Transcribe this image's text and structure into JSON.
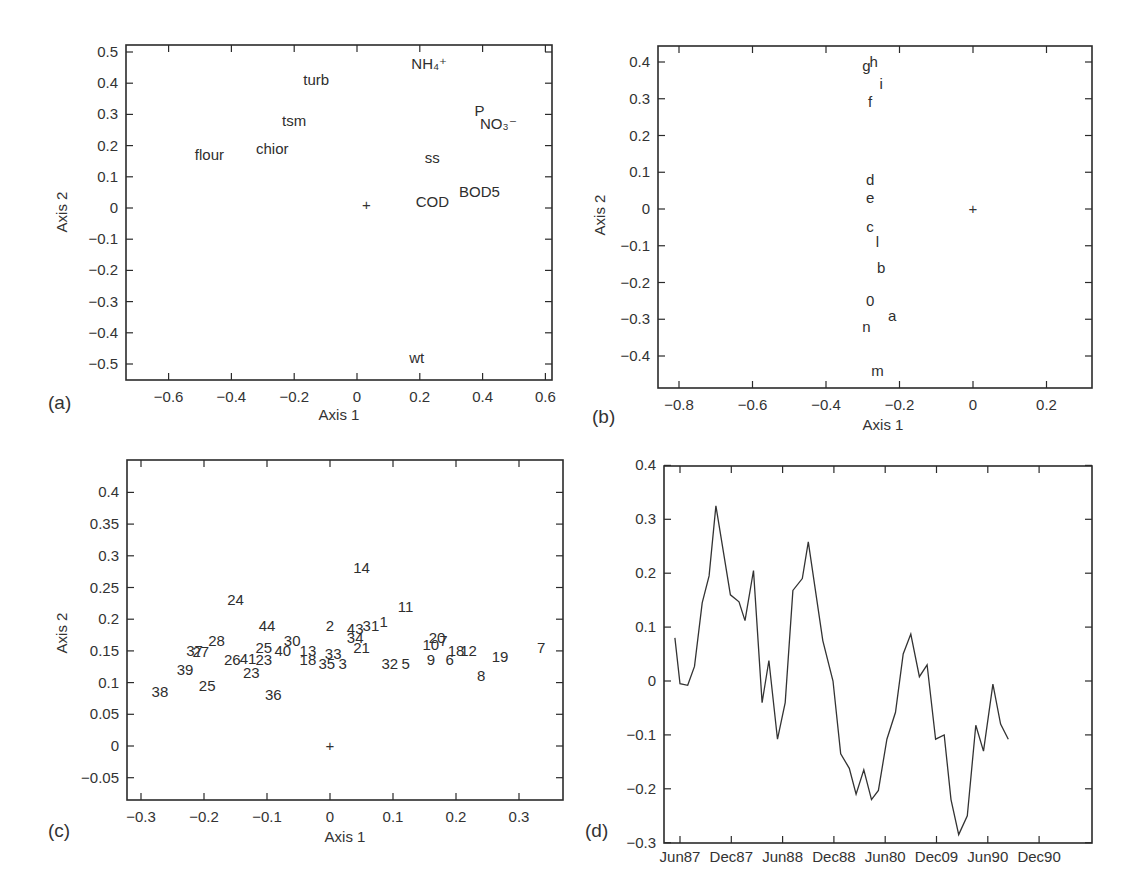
{
  "chart_data": [
    {
      "id": "a",
      "type": "scatter",
      "panel_label": "(a)",
      "title": "",
      "xlabel": "Axis 1",
      "ylabel": "Axis 2",
      "xlim": [
        -0.73,
        0.62
      ],
      "ylim": [
        -0.55,
        0.52
      ],
      "grid": false,
      "xticks": [
        -0.6,
        -0.4,
        -0.2,
        0,
        0.2,
        0.4,
        0.6
      ],
      "xtick_labels": [
        "−0.6",
        "−0.4",
        "−0.2",
        "0",
        "0.2",
        "0.4",
        "0.6"
      ],
      "yticks": [
        0.5,
        0.4,
        0.3,
        0.2,
        0.1,
        0,
        -0.1,
        -0.2,
        -0.3,
        -0.4,
        -0.5
      ],
      "ytick_labels": [
        "0.5",
        "0.4",
        "0.3",
        "0.2",
        "0.1",
        "0",
        "−0.1",
        "−0.2",
        "−0.3",
        "−0.4",
        "−0.5"
      ],
      "origin_marker": {
        "x": 0.03,
        "y": 0.01,
        "symbol": "+"
      },
      "points": [
        {
          "label": "turb",
          "x": -0.13,
          "y": 0.41
        },
        {
          "label": "NH₄⁺",
          "x": 0.23,
          "y": 0.46
        },
        {
          "label": "tsm",
          "x": -0.2,
          "y": 0.28
        },
        {
          "label": "P",
          "x": 0.39,
          "y": 0.31
        },
        {
          "label": "NO₃⁻",
          "x": 0.45,
          "y": 0.27
        },
        {
          "label": "flour",
          "x": -0.47,
          "y": 0.17
        },
        {
          "label": "chior",
          "x": -0.27,
          "y": 0.19
        },
        {
          "label": "ss",
          "x": 0.24,
          "y": 0.16
        },
        {
          "label": "COD",
          "x": 0.24,
          "y": 0.02
        },
        {
          "label": "BOD5",
          "x": 0.39,
          "y": 0.05
        },
        {
          "label": "wt",
          "x": 0.19,
          "y": -0.48
        }
      ]
    },
    {
      "id": "b",
      "type": "scatter",
      "panel_label": "(b)",
      "title": "",
      "xlabel": "Axis 1",
      "ylabel": "Axis 2",
      "xlim": [
        -0.86,
        0.32
      ],
      "ylim": [
        -0.48,
        0.45
      ],
      "grid": false,
      "xticks": [
        -0.8,
        -0.6,
        -0.4,
        -0.2,
        0,
        0.2
      ],
      "xtick_labels": [
        "−0.8",
        "−0.6",
        "−0.4",
        "−0.2",
        "0",
        "0.2"
      ],
      "yticks": [
        0.4,
        0.3,
        0.2,
        0.1,
        0,
        -0.1,
        -0.2,
        -0.3,
        -0.4
      ],
      "ytick_labels": [
        "0.4",
        "0.3",
        "0.2",
        "0.1",
        "0",
        "−0.1",
        "−0.2",
        "−0.3",
        "−0.4"
      ],
      "origin_marker": {
        "x": 0.0,
        "y": 0.0,
        "symbol": "+"
      },
      "points": [
        {
          "label": "g",
          "x": -0.29,
          "y": 0.39
        },
        {
          "label": "h",
          "x": -0.27,
          "y": 0.4
        },
        {
          "label": "i",
          "x": -0.25,
          "y": 0.34
        },
        {
          "label": "f",
          "x": -0.28,
          "y": 0.29
        },
        {
          "label": "d",
          "x": -0.28,
          "y": 0.08
        },
        {
          "label": "e",
          "x": -0.28,
          "y": 0.03
        },
        {
          "label": "c",
          "x": -0.28,
          "y": -0.05
        },
        {
          "label": "l",
          "x": -0.26,
          "y": -0.09
        },
        {
          "label": "b",
          "x": -0.25,
          "y": -0.16
        },
        {
          "label": "0",
          "x": -0.28,
          "y": -0.25
        },
        {
          "label": "a",
          "x": -0.22,
          "y": -0.29
        },
        {
          "label": "n",
          "x": -0.29,
          "y": -0.32
        },
        {
          "label": "m",
          "x": -0.26,
          "y": -0.44
        }
      ]
    },
    {
      "id": "c",
      "type": "scatter",
      "panel_label": "(c)",
      "title": "",
      "xlabel": "Axis 1",
      "ylabel": "Axis 2",
      "xlim": [
        -0.32,
        0.37
      ],
      "ylim": [
        -0.09,
        0.45
      ],
      "grid": false,
      "xticks": [
        -0.3,
        -0.2,
        -0.1,
        0,
        0.1,
        0.2,
        0.3
      ],
      "xtick_labels": [
        "−0.3",
        "−0.2",
        "−0.1",
        "0",
        "0.1",
        "0.2",
        "0.3"
      ],
      "yticks": [
        0.4,
        0.35,
        0.3,
        0.25,
        0.2,
        0.15,
        0.1,
        0.05,
        0,
        -0.05
      ],
      "ytick_labels": [
        "0.4",
        "0.35",
        "0.3",
        "0.25",
        "0.2",
        "0.15",
        "0.1",
        "0.05",
        "0",
        "−0.05"
      ],
      "origin_marker": {
        "x": 0.0,
        "y": 0.0,
        "symbol": "+"
      },
      "points": [
        {
          "label": "14",
          "x": 0.05,
          "y": 0.28
        },
        {
          "label": "24",
          "x": -0.15,
          "y": 0.23
        },
        {
          "label": "11",
          "x": 0.12,
          "y": 0.22
        },
        {
          "label": "44",
          "x": -0.1,
          "y": 0.19
        },
        {
          "label": "2",
          "x": 0.0,
          "y": 0.19
        },
        {
          "label": "43",
          "x": 0.04,
          "y": 0.185
        },
        {
          "label": "31",
          "x": 0.065,
          "y": 0.19
        },
        {
          "label": "1",
          "x": 0.085,
          "y": 0.195
        },
        {
          "label": "34",
          "x": 0.04,
          "y": 0.17
        },
        {
          "label": "30",
          "x": -0.06,
          "y": 0.165
        },
        {
          "label": "28",
          "x": -0.18,
          "y": 0.165
        },
        {
          "label": "37",
          "x": -0.215,
          "y": 0.15
        },
        {
          "label": "27",
          "x": -0.205,
          "y": 0.148
        },
        {
          "label": "20",
          "x": 0.17,
          "y": 0.17
        },
        {
          "label": "10",
          "x": 0.16,
          "y": 0.16
        },
        {
          "label": "7",
          "x": 0.18,
          "y": 0.165
        },
        {
          "label": "25",
          "x": -0.105,
          "y": 0.155
        },
        {
          "label": "40",
          "x": -0.075,
          "y": 0.15
        },
        {
          "label": "13",
          "x": -0.035,
          "y": 0.15
        },
        {
          "label": "21",
          "x": 0.05,
          "y": 0.155
        },
        {
          "label": "26",
          "x": -0.155,
          "y": 0.135
        },
        {
          "label": "41",
          "x": -0.13,
          "y": 0.138
        },
        {
          "label": "23",
          "x": -0.105,
          "y": 0.135
        },
        {
          "label": "18",
          "x": -0.035,
          "y": 0.135
        },
        {
          "label": "33",
          "x": 0.005,
          "y": 0.145
        },
        {
          "label": "35",
          "x": -0.005,
          "y": 0.13
        },
        {
          "label": "3",
          "x": 0.02,
          "y": 0.13
        },
        {
          "label": "32",
          "x": 0.095,
          "y": 0.13
        },
        {
          "label": "5",
          "x": 0.12,
          "y": 0.13
        },
        {
          "label": "9",
          "x": 0.16,
          "y": 0.135
        },
        {
          "label": "6",
          "x": 0.19,
          "y": 0.135
        },
        {
          "label": "18",
          "x": 0.2,
          "y": 0.15
        },
        {
          "label": "12",
          "x": 0.22,
          "y": 0.15
        },
        {
          "label": "19",
          "x": 0.27,
          "y": 0.14
        },
        {
          "label": "7",
          "x": 0.335,
          "y": 0.155
        },
        {
          "label": "8",
          "x": 0.24,
          "y": 0.11
        },
        {
          "label": "39",
          "x": -0.23,
          "y": 0.12
        },
        {
          "label": "23",
          "x": -0.125,
          "y": 0.115
        },
        {
          "label": "25",
          "x": -0.195,
          "y": 0.095
        },
        {
          "label": "38",
          "x": -0.27,
          "y": 0.085
        },
        {
          "label": "36",
          "x": -0.09,
          "y": 0.08
        }
      ]
    },
    {
      "id": "d",
      "type": "line",
      "panel_label": "(d)",
      "title": "",
      "xlabel": "",
      "ylabel": "",
      "ylim": [
        -0.3,
        0.4
      ],
      "grid": false,
      "xtick_labels": [
        "Jun87",
        "Dec87",
        "Jun88",
        "Dec88",
        "Jun80",
        "Dec09",
        "Jun90",
        "Dec90"
      ],
      "yticks": [
        0.4,
        0.3,
        0.2,
        0.1,
        0,
        -0.1,
        -0.2,
        -0.3
      ],
      "ytick_labels": [
        "0.4",
        "0.3",
        "0.2",
        "0.1",
        "0",
        "−0.1",
        "−0.2",
        "−0.3"
      ],
      "series": [
        {
          "name": "Axis 1 score over time",
          "x_months_from_jun87": [
            -0.6,
            0.0,
            0.9,
            1.7,
            2.6,
            3.4,
            4.2,
            5.9,
            6.9,
            7.6,
            8.6,
            9.6,
            10.4,
            11.4,
            12.3,
            13.2,
            14.3,
            15.0,
            16.7,
            17.9,
            18.8,
            19.8,
            20.6,
            21.5,
            22.4,
            23.2,
            24.2,
            25.2,
            26.1,
            27.0,
            28.0,
            28.9,
            29.9,
            30.9,
            31.7,
            32.6,
            33.6,
            34.6,
            35.5,
            36.6,
            37.5,
            38.4
          ],
          "values": [
            0.08,
            -0.005,
            -0.008,
            0.027,
            0.145,
            0.195,
            0.325,
            0.16,
            0.147,
            0.112,
            0.205,
            -0.04,
            0.038,
            -0.108,
            -0.04,
            0.168,
            0.19,
            0.258,
            0.075,
            0.0,
            -0.135,
            -0.162,
            -0.21,
            -0.165,
            -0.22,
            -0.203,
            -0.108,
            -0.058,
            0.05,
            0.087,
            0.008,
            0.03,
            -0.108,
            -0.1,
            -0.22,
            -0.285,
            -0.25,
            -0.082,
            -0.13,
            -0.006,
            -0.08,
            -0.108
          ]
        }
      ]
    }
  ]
}
